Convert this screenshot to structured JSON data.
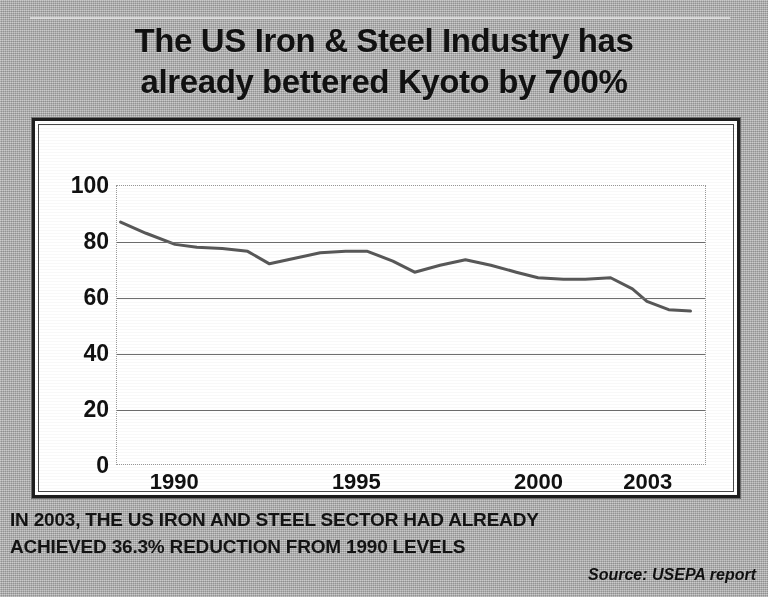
{
  "headline": {
    "line1": "The US Iron & Steel Industry has",
    "line2": "already bettered Kyoto by 700%"
  },
  "caption": {
    "line1": "IN 2003, THE US IRON AND STEEL SECTOR HAD ALREADY",
    "line2": "ACHIEVED 36.3% REDUCTION FROM 1990 LEVELS"
  },
  "source": "Source: USEPA report",
  "colors": {
    "background": "#b4b4b4",
    "panel": "#ffffff",
    "frame": "#1d1d1d",
    "line": "#585858",
    "gridline": "#6f6f6f",
    "text": "#111111"
  },
  "chart_data": {
    "type": "line",
    "title": "",
    "xlabel": "",
    "ylabel": "",
    "grid": true,
    "legend": "none",
    "xlim": [
      1988.4,
      2004.6
    ],
    "ylim": [
      0,
      100
    ],
    "ytick_labels": [
      "100",
      "80",
      "60",
      "40",
      "20",
      "0"
    ],
    "yticks": [
      100,
      80,
      60,
      40,
      20,
      0
    ],
    "xtick_labels": [
      "1990",
      "1995",
      "2000",
      "2003"
    ],
    "xticks": [
      1990,
      1995,
      2000,
      2003
    ],
    "series": [
      {
        "name": "US Iron & Steel GHG index",
        "x": [
          1988.5,
          1989.2,
          1990.0,
          1990.6,
          1991.3,
          1992.0,
          1992.6,
          1993.3,
          1994.0,
          1994.7,
          1995.3,
          1996.0,
          1996.6,
          1997.3,
          1998.0,
          1998.7,
          1999.4,
          2000.0,
          2000.7,
          2001.3,
          2002.0,
          2002.6,
          2003.0,
          2003.6,
          2004.2
        ],
        "y": [
          87.0,
          83.0,
          79.0,
          78.0,
          77.5,
          76.5,
          72.0,
          74.0,
          76.0,
          76.5,
          76.5,
          73.0,
          69.0,
          71.5,
          73.5,
          71.5,
          69.0,
          67.0,
          66.5,
          66.5,
          67.0,
          63.0,
          58.5,
          55.5,
          55.0
        ]
      }
    ]
  }
}
